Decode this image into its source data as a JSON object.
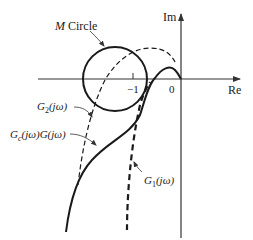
{
  "diagram": {
    "type": "nyquist-plot-with-m-circle",
    "axes": {
      "real_label": "Re",
      "imag_label": "Im",
      "tick_minus_one": "−1",
      "tick_zero": "0"
    },
    "labels": {
      "m_circle_italic": "M",
      "m_circle_rest": " Circle",
      "g2": "G",
      "g2_sub": "2",
      "g2_arg": "(jω)",
      "gc": "G",
      "gc_sub": "c",
      "gc_arg": "(jω)G(jω)",
      "g1": "G",
      "g1_sub": "1",
      "g1_arg": "(jω)"
    },
    "colors": {
      "stroke": "#1a1a1a",
      "axis": "#333333",
      "background": "#ffffff"
    }
  }
}
